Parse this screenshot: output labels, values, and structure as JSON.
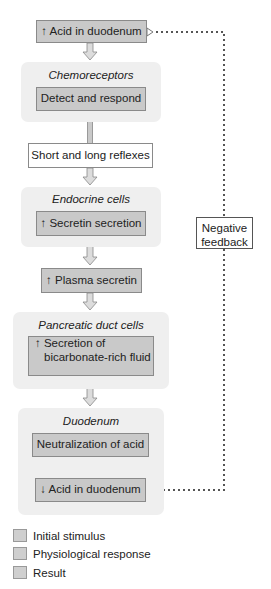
{
  "diagram": {
    "top_box": "↑ Acid in duodenum",
    "groups": [
      {
        "label": "Chemoreceptors",
        "box": "Detect and respond"
      },
      {
        "label": "Endocrine cells",
        "box": "↑ Secretin secretion"
      },
      {
        "label": "Pancreatic duct cells",
        "box_line1": "↑ Secretion of",
        "box_line2": "bicarbonate-rich fluid"
      },
      {
        "label": "Duodenum",
        "box": "Neutralization of acid",
        "result_box": "↓ Acid in duodenum"
      }
    ],
    "reflex_box": "Short and long reflexes",
    "plasma_box": "↑ Plasma secretin",
    "feedback_line1": "Negative",
    "feedback_line2": "feedback"
  },
  "legend": [
    {
      "label": "Initial stimulus"
    },
    {
      "label": "Physiological response"
    },
    {
      "label": "Result"
    }
  ]
}
